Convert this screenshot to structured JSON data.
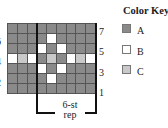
{
  "chart_data": {
    "type": "table",
    "rows_top_to_bottom": [
      {
        "row": 7,
        "cells": [
          "A",
          "A",
          "A",
          "A",
          "A",
          "A",
          "A",
          "A",
          "A"
        ]
      },
      {
        "row": 6,
        "cells": [
          "A",
          "A",
          "A",
          "A",
          "B",
          "A",
          "A",
          "A",
          "A"
        ]
      },
      {
        "row": 5,
        "cells": [
          "A",
          "A",
          "A",
          "B",
          "A",
          "B",
          "A",
          "A",
          "A"
        ]
      },
      {
        "row": 4,
        "cells": [
          "B",
          "C",
          "B",
          "A",
          "C",
          "A",
          "B",
          "C",
          "B"
        ]
      },
      {
        "row": 3,
        "cells": [
          "A",
          "A",
          "A",
          "B",
          "A",
          "B",
          "A",
          "A",
          "A"
        ]
      },
      {
        "row": 2,
        "cells": [
          "A",
          "A",
          "A",
          "A",
          "B",
          "A",
          "A",
          "A",
          "A"
        ]
      },
      {
        "row": 1,
        "cells": [
          "A",
          "A",
          "A",
          "A",
          "A",
          "A",
          "A",
          "A",
          "A"
        ]
      }
    ],
    "right_row_labels": [
      "7",
      "5",
      "3",
      "1"
    ],
    "left_row_labels": [
      "6",
      "4",
      "2"
    ],
    "repeat_label": "6-st rep"
  },
  "labels": {
    "right": [
      "7",
      "5",
      "3",
      "1"
    ],
    "left": [
      "6",
      "4",
      "2"
    ],
    "rep_line1": "6-st",
    "rep_line2": "rep"
  },
  "key": {
    "title": "Color Key",
    "items": [
      {
        "label": "A",
        "color": "#8a8a8a"
      },
      {
        "label": "B",
        "color": "#ffffff"
      },
      {
        "label": "C",
        "color": "#c9c9c9"
      }
    ]
  }
}
